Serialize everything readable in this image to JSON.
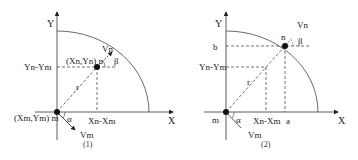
{
  "diagrams": [
    {
      "caption": "(1)",
      "axis_x": "X",
      "axis_y": "Y",
      "point_n_label": "(Xn,Yn) n",
      "point_m_label": "(Xm,Ym) m",
      "vn_label": "Vn",
      "vm_label": "Vm",
      "beta_label": "β",
      "alpha_label": "α",
      "r_label": "r",
      "y_diff_label": "Yn-Ym",
      "x_diff_label": "Xn-Xm"
    },
    {
      "caption": "(2)",
      "axis_x": "X",
      "axis_y": "Y",
      "point_n_label": "n",
      "point_m_label": "m",
      "vn_label": "Vn",
      "vm_label": "Vm",
      "beta_label": "β",
      "alpha_label": "α",
      "r_label": "r",
      "y_diff_label": "Yn-Ym",
      "x_diff_label": "Xn-Xm",
      "b_label": "b",
      "a_label": "a"
    }
  ]
}
